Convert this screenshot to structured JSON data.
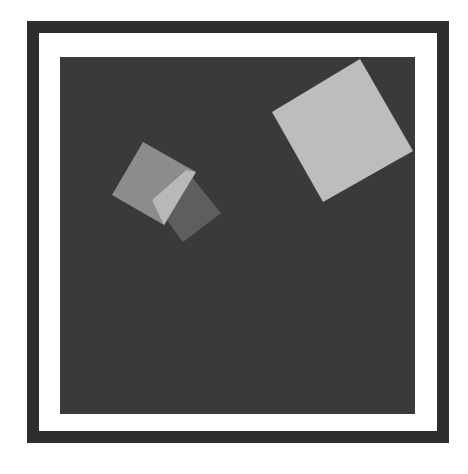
{
  "scene": {
    "description": "Dark square inside a white-matted dark frame, containing rotated gray squares",
    "colors": {
      "frame": "#2e2e2e",
      "mat": "#ffffff",
      "background": "#3a3a3a",
      "large_square": "#bdbdbd",
      "square_a": "#8c8c8c",
      "square_b": "#5e5e5e",
      "overlap": "#b8b8b8"
    },
    "shapes": [
      {
        "name": "large-square",
        "points": "360,59 413,151 323,202 272,112"
      },
      {
        "name": "small-square-a",
        "points": "143,142 196,172 164,225 112,195"
      },
      {
        "name": "small-square-b",
        "points": "186,170 221,213 183,242 152,200"
      },
      {
        "name": "overlap-region",
        "points": "186,170 196,172 164,225 152,200"
      }
    ]
  }
}
